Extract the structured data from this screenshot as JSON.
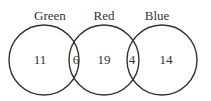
{
  "diagram": {
    "type": "venn",
    "sets": [
      {
        "name": "Green",
        "only": "11"
      },
      {
        "name": "Red",
        "only": "19"
      },
      {
        "name": "Blue",
        "only": "14"
      }
    ],
    "intersections": {
      "green_red": "6",
      "red_blue": "4"
    },
    "colors": {
      "stroke": "#333333",
      "text": "#333333",
      "background": "#ffffff"
    }
  }
}
